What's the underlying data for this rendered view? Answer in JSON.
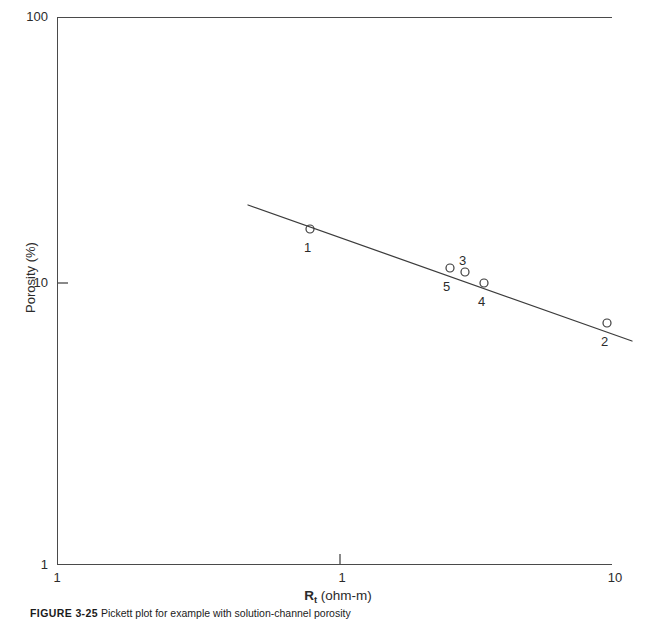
{
  "figure": {
    "caption_number": "FIGURE 3-25",
    "caption_text": "Pickett plot for example with solution-channel porosity",
    "background_color": "#ffffff",
    "line_color": "#3c3c3c",
    "marker_color": "#3c3c3c"
  },
  "axes": {
    "y_title": "Porosity (%)",
    "x_title_symbol": "R",
    "x_title_subscript": "t",
    "x_title_unit": "(ohm-m)",
    "y_ticks": [
      "100",
      "10",
      "1"
    ],
    "x_ticks": [
      "1",
      "1",
      "10"
    ],
    "y_min": 1,
    "y_max": 100,
    "x_min": 1,
    "x_max": 10,
    "scale": "log-log"
  },
  "chart_data": {
    "type": "scatter",
    "title": "",
    "xlabel": "Rt (ohm-m)",
    "ylabel": "Porosity (%)",
    "xscale": "log",
    "yscale": "log",
    "xlim": [
      1,
      10
    ],
    "ylim": [
      1,
      100
    ],
    "grid": false,
    "legend": "none",
    "point_labels": [
      "1",
      "2",
      "3",
      "4",
      "5"
    ],
    "points": [
      {
        "label": "1",
        "x": 0.83,
        "y": 14.3,
        "px": 310,
        "py": 229,
        "label_dx": -2,
        "label_dy": 12
      },
      {
        "label": "2",
        "x": 7.8,
        "y": 7.6,
        "px": 607,
        "py": 323,
        "label_dx": -2,
        "label_dy": 12
      },
      {
        "label": "3",
        "x": 2.75,
        "y": 10.4,
        "px": 465,
        "py": 272,
        "label_dx": -2,
        "label_dy": -18
      },
      {
        "label": "4",
        "x": 3.3,
        "y": 9.5,
        "px": 484,
        "py": 283,
        "label_dx": -2,
        "label_dy": 12
      },
      {
        "label": "5",
        "x": 2.45,
        "y": 10.7,
        "px": 450,
        "py": 268,
        "label_dx": -3,
        "label_dy": 12
      }
    ],
    "trend_line": {
      "x_start_px": 248,
      "y_start_px": 205,
      "x_end_px": 632,
      "y_end_px": 341,
      "x_start": 0.46,
      "y_start": 17.3,
      "x_end": 11.4,
      "y_end": 6.6,
      "slope_m": -0.35
    },
    "marker_radius_px": 4
  }
}
